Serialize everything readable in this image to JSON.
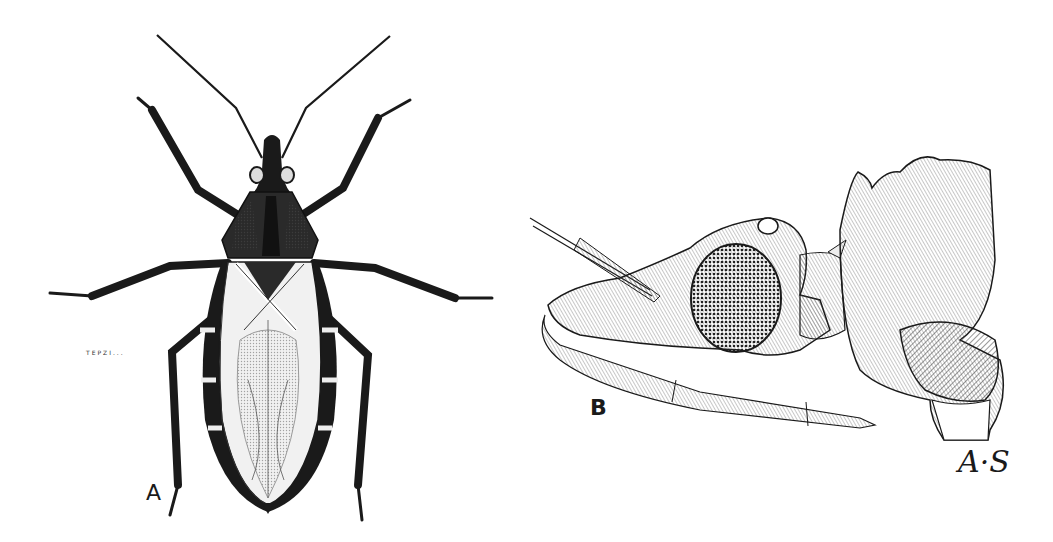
{
  "figure": {
    "panels": [
      {
        "id": "A",
        "label": "A",
        "subject": "dorsal view of assassin (kissing) bug, full body with antennae and legs"
      },
      {
        "id": "B",
        "label": "B",
        "subject": "lateral view of head with compound eye, antenna base, and proboscis"
      }
    ],
    "engraver_mark": "TEPZI...",
    "signature": "A·S",
    "colors": {
      "ink": "#1a1a1a",
      "background": "#ffffff",
      "shade": "#555555"
    }
  }
}
